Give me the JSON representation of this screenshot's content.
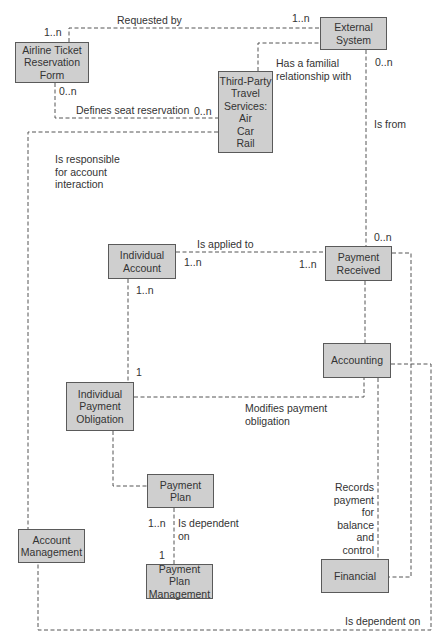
{
  "diagram": {
    "type": "entity-relationship",
    "style": {
      "box_fill": "#cfcfcf",
      "box_border": "#5a5a5a",
      "line_color": "#555555",
      "text_color": "#333333",
      "background": "#ffffff"
    },
    "entities": [
      {
        "id": "airline_form",
        "label": "Airline Ticket\nReservation\nForm"
      },
      {
        "id": "external_system",
        "label": "External\nSystem"
      },
      {
        "id": "third_party",
        "label": "Third-Party\nTravel\nServices:\nAir\nCar\nRail"
      },
      {
        "id": "individual_account",
        "label": "Individual\nAccount"
      },
      {
        "id": "payment_received",
        "label": "Payment\nReceived"
      },
      {
        "id": "accounting",
        "label": "Accounting"
      },
      {
        "id": "individual_payment_obligation",
        "label": "Individual\nPayment\nObligation"
      },
      {
        "id": "payment_plan",
        "label": "Payment\nPlan"
      },
      {
        "id": "account_management",
        "label": "Account\nManagement"
      },
      {
        "id": "payment_plan_management",
        "label": "Payment Plan\nManagement"
      },
      {
        "id": "financial",
        "label": "Financial"
      }
    ],
    "relationships": [
      {
        "from": "airline_form",
        "to": "external_system",
        "label": "Requested by",
        "from_card": "1..n",
        "to_card": "1..n"
      },
      {
        "from": "third_party",
        "to": "external_system",
        "label": "Has a familial\nrelationship with"
      },
      {
        "from": "airline_form",
        "to": "third_party",
        "label": "Defines seat reservation",
        "from_card": "0..n",
        "to_card": "0..n"
      },
      {
        "from": "third_party",
        "to": "account_management",
        "label": "Is responsible\nfor account\ninteraction"
      },
      {
        "from": "external_system",
        "to": "payment_received",
        "label": "Is from",
        "from_card": "0..n",
        "to_card": "0..n"
      },
      {
        "from": "individual_account",
        "to": "payment_received",
        "label": "Is applied to",
        "from_card": "1..n",
        "to_card": "1..n"
      },
      {
        "from": "individual_account",
        "to": "individual_payment_obligation",
        "from_card": "1..n",
        "to_card": "1"
      },
      {
        "from": "accounting",
        "to": "individual_payment_obligation",
        "label": "Modifies payment\nobligation"
      },
      {
        "from": "accounting",
        "to": "financial",
        "label": "Records\npayment\nfor\nbalance\nand\ncontrol"
      },
      {
        "from": "individual_payment_obligation",
        "to": "payment_plan"
      },
      {
        "from": "payment_plan",
        "to": "payment_plan_management",
        "label": "Is dependent\non",
        "from_card": "1..n",
        "to_card": "1"
      },
      {
        "from": "account_management",
        "to": "accounting",
        "label": "Is dependent on"
      },
      {
        "from": "payment_received",
        "to": "financial"
      }
    ]
  }
}
